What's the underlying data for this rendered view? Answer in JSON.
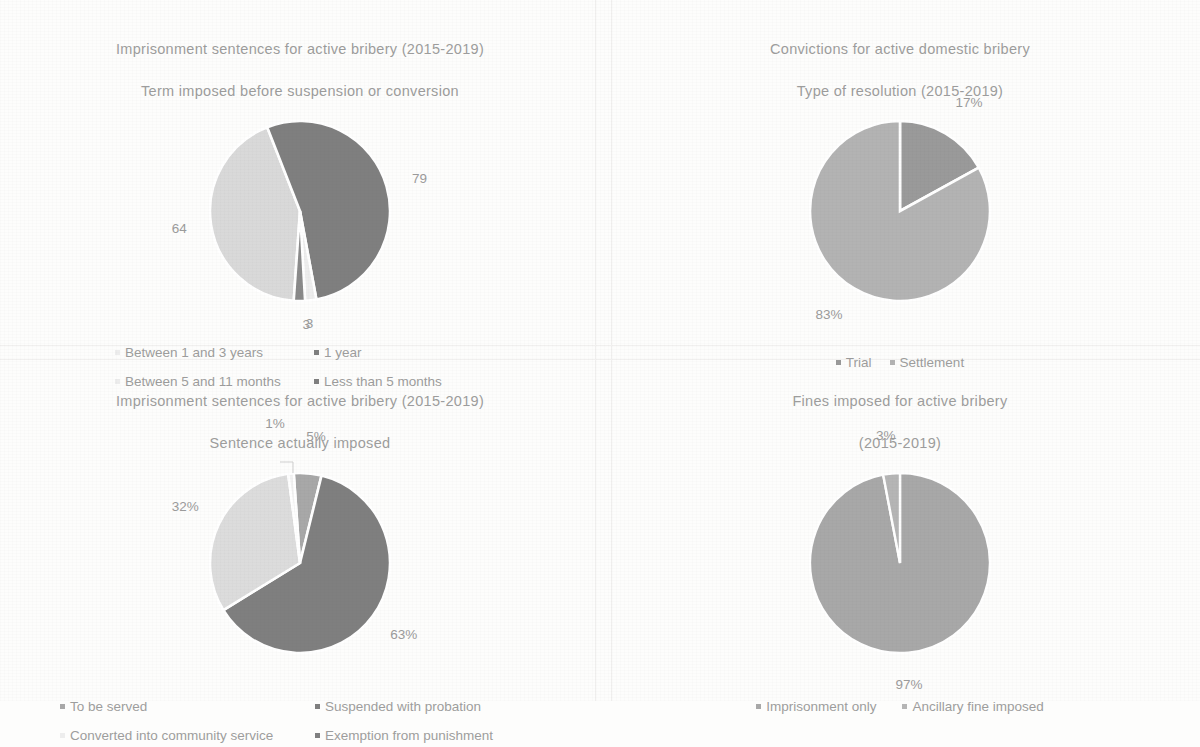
{
  "page": {
    "background": "#fdfdfc",
    "text_color": "#9d9d9d"
  },
  "palette": {
    "dark_gray": "#7f7f7f",
    "mid_gray": "#a6a6a6",
    "light_gray": "#d9d9d9",
    "very_light_gray": "#ededed",
    "near_white": "#f2f2f2"
  },
  "charts": [
    {
      "id": "imprisonment-term-before-suspension",
      "chart_data": {
        "type": "pie",
        "title": "Imprisonment sentences for active bribery (2015-2019)\nTerm imposed before suspension or conversion",
        "title_line1": "Imprisonment sentences for active bribery (2015-2019)",
        "title_line2": "Term imposed before suspension or conversion",
        "categories": [
          "Between 1 and 3 years",
          "1 year",
          "Between 5 and 11 months",
          "Less than 5 months"
        ],
        "values": [
          64,
          79,
          3,
          3
        ],
        "labels": [
          "64",
          "79",
          "3",
          "3"
        ],
        "colors": [
          "#d9d9d9",
          "#7f7f7f",
          "#ededed",
          "#8a8a8a"
        ],
        "legend_position": "bottom",
        "legend": [
          "Between 1 and 3 years",
          "1 year",
          "Between 5 and 11 months",
          "Less than 5 months"
        ],
        "legend_marker_colors": [
          "#ededed",
          "#7f7f7f",
          "#ededed",
          "#808080"
        ],
        "units": "cases"
      }
    },
    {
      "id": "convictions-type-of-resolution",
      "chart_data": {
        "type": "pie",
        "title": "Convictions for active domestic bribery\nType of resolution (2015-2019)",
        "title_line1": "Convictions for active domestic bribery",
        "title_line2": "Type of resolution (2015-2019)",
        "categories": [
          "Trial",
          "Settlement"
        ],
        "values": [
          17,
          83
        ],
        "labels": [
          "17%",
          "83%"
        ],
        "colors": [
          "#9a9a9a",
          "#b3b3b3"
        ],
        "legend_position": "bottom",
        "legend": [
          "Trial",
          "Settlement"
        ],
        "legend_marker_colors": [
          "#9a9a9a",
          "#b3b3b3"
        ],
        "units": "percent"
      }
    },
    {
      "id": "imprisonment-sentence-actually-imposed",
      "chart_data": {
        "type": "pie",
        "title": "Imprisonment sentences for active bribery (2015-2019)\nSentence actually imposed",
        "title_line1": "Imprisonment sentences for active bribery (2015-2019)",
        "title_line2": "Sentence actually imposed",
        "categories": [
          "To be served",
          "Suspended with probation",
          "Converted into community service",
          "Exemption from punishment"
        ],
        "values": [
          5,
          63,
          32,
          1
        ],
        "labels": [
          "5%",
          "63%",
          "32%",
          "1%"
        ],
        "colors": [
          "#a8a8a8",
          "#7f7f7f",
          "#dcdcdc",
          "#f2f2f2"
        ],
        "legend_position": "bottom",
        "legend": [
          "To be served",
          "Suspended with probation",
          "Converted into community service",
          "Exemption from punishment"
        ],
        "legend_marker_colors": [
          "#a8a8a8",
          "#7f7f7f",
          "#ededed",
          "#808080"
        ],
        "units": "percent"
      }
    },
    {
      "id": "fines-imposed-active-bribery",
      "chart_data": {
        "type": "pie",
        "title": "Fines imposed for active bribery\n(2015-2019)",
        "title_line1": "Fines imposed for active bribery",
        "title_line2": "(2015-2019)",
        "categories": [
          "Imprisonment only",
          "Ancillary fine imposed"
        ],
        "values": [
          97,
          3
        ],
        "labels": [
          "97%",
          "3%"
        ],
        "colors": [
          "#a8a8a8",
          "#b5b5b5"
        ],
        "legend_position": "bottom",
        "legend": [
          "Imprisonment only",
          "Ancillary fine imposed"
        ],
        "legend_marker_colors": [
          "#a8a8a8",
          "#b5b5b5"
        ],
        "units": "percent"
      }
    }
  ]
}
